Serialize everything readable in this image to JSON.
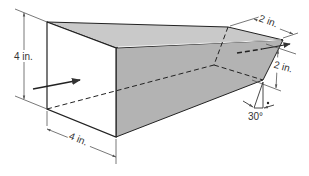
{
  "figure": {
    "labels": {
      "inlet_height": "4 in.",
      "inlet_width": "4 in.",
      "outlet_width": "2 in.",
      "outlet_height": "2 in.",
      "angle": "30°"
    },
    "colors": {
      "top_face": "#c8c8c8",
      "side_face": "#b0b0b0",
      "front_face": "#ffffff",
      "edge": "#222222",
      "dimension": "#555555"
    }
  }
}
